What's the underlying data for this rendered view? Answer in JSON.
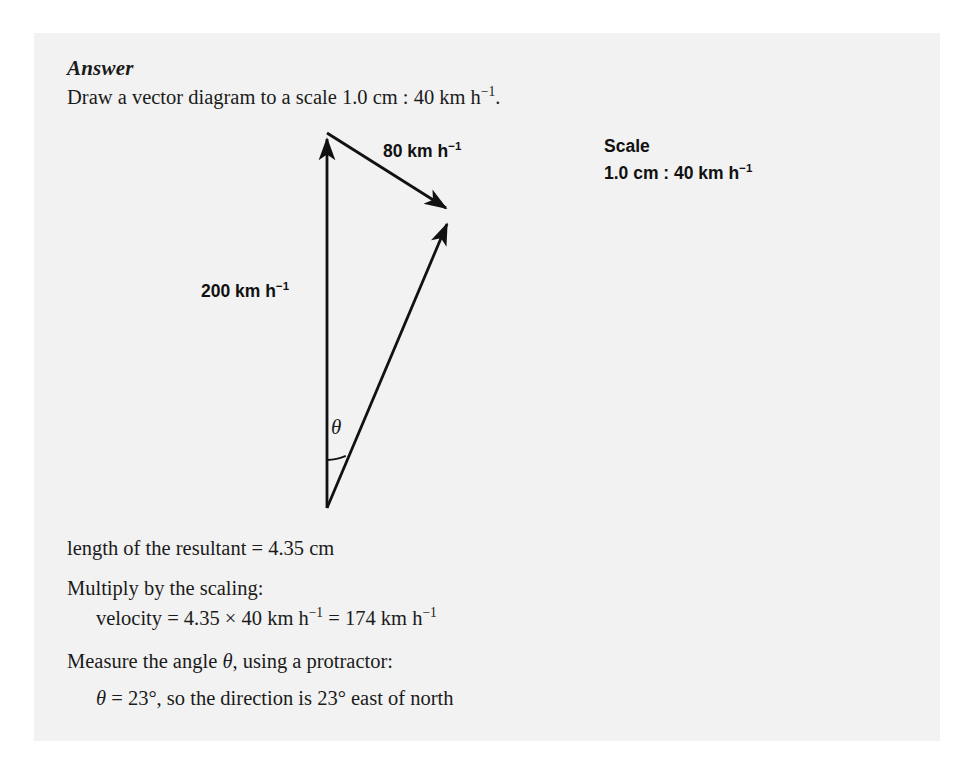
{
  "page": {
    "background_color": "#ffffff",
    "panel_color": "#f2f2f2",
    "ink_color": "#1b1b1b"
  },
  "answer": {
    "heading": "Answer",
    "intro_prefix": "Draw a vector diagram to a scale ",
    "intro_scale": "1.0 cm : 40 km h",
    "intro_exponent": "−1",
    "intro_suffix": "."
  },
  "diagram": {
    "vector_80_value": "80 km h",
    "vector_80_exponent": "−1",
    "vector_200_value": "200 km h",
    "vector_200_exponent": "−1",
    "angle_symbol": "θ",
    "scale_box": {
      "title": "Scale",
      "value": "1.0 cm : 40 km h",
      "exponent": "−1"
    },
    "geometry": {
      "origin": [
        327,
        508
      ],
      "apex_200": [
        327,
        133
      ],
      "resultant_tip": [
        452,
        212
      ],
      "vector_200_label_position": [
        201,
        281
      ],
      "vector_80_label_position": [
        383,
        141
      ],
      "angle_arc_radius": 48,
      "stroke_color": "#111111"
    }
  },
  "working": {
    "resultant_length": "length of the resultant = 4.35 cm",
    "multiply_label": "Multiply by the scaling:",
    "velocity_prefix": "velocity = 4.35 × 40 km h",
    "velocity_exponent_1": "−1",
    "velocity_middle": " = 174 km h",
    "velocity_exponent_2": "−1",
    "measure_label_prefix": "Measure the angle ",
    "measure_label_symbol": "θ",
    "measure_label_suffix": ", using a protractor:",
    "theta_result_symbol": "θ",
    "theta_result": " = 23°, so the direction is 23° east of north"
  }
}
